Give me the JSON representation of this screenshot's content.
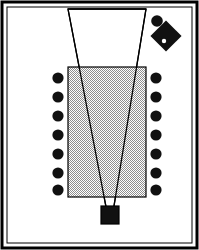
{
  "figure": {
    "canvas": {
      "width": 199,
      "height": 250
    },
    "colors": {
      "background": "#ffffff",
      "ink": "#000000",
      "table_fill": "#c9c9c9",
      "chair_fill": "#111111",
      "camera_fill": "#111111",
      "object_fill": "#111111",
      "fov_fill": "#ffffff"
    }
  },
  "frame": {
    "outer": {
      "x": 2,
      "y": 2,
      "width": 195,
      "height": 246,
      "stroke_width": 3
    },
    "inner": {
      "x": 7,
      "y": 7,
      "width": 185,
      "height": 236,
      "stroke_width": 1
    }
  },
  "table": {
    "label": "conference-table",
    "x": 68,
    "y": 67,
    "width": 78,
    "height": 130,
    "stroke_width": 1.2,
    "fill_pattern": "checker-dither-50"
  },
  "fov": {
    "label": "camera-field-of-view",
    "apex": {
      "x": 110,
      "y": 212
    },
    "top_left": {
      "x": 68,
      "y": 9
    },
    "top_right": {
      "x": 146,
      "y": 9
    },
    "stroke_width": 1.3,
    "polygon_points": "68,9 146,9 113,212 107,212"
  },
  "camera": {
    "label": "camera",
    "x": 101,
    "y": 206,
    "width": 18,
    "height": 18,
    "stroke_width": 1.2
  },
  "chairs": {
    "label": "chairs",
    "radius": 5.6,
    "left_x": 58,
    "right_x": 156,
    "rows_y": [
      78,
      97,
      116,
      135,
      154,
      173,
      190
    ],
    "count_left": 7,
    "count_right": 7,
    "count_total": 14
  },
  "objects": [
    {
      "name": "round-object",
      "shape": "circle",
      "cx": 157,
      "cy": 21,
      "r": 5.8
    },
    {
      "name": "diamond-object",
      "shape": "rotated-square",
      "cx": 166,
      "cy": 36,
      "half": 11,
      "rotation": 45,
      "notch": {
        "cx": 164,
        "cy": 41,
        "r": 2.2
      }
    }
  ]
}
